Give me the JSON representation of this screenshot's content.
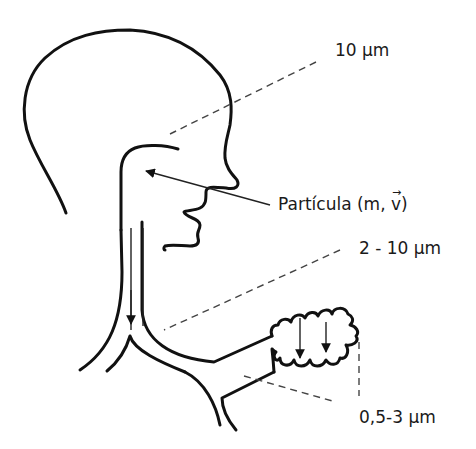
{
  "labels": {
    "upper_airway": "10 µm",
    "particle_prefix": "Partícula (m, ",
    "particle_vector": "v",
    "particle_suffix": ")",
    "vector_arrow": "→",
    "bronchi": "2 - 10 µm",
    "alveoli": "0,5-3 µm"
  },
  "figure": {
    "parts": [
      "head",
      "nasal-cavity",
      "trachea",
      "bronchi",
      "bronchiole",
      "alveoli"
    ],
    "arrows": [
      "particle-inhalation-arrow",
      "trachea-deposition-arrow",
      "alveoli-deposition-arrow-1",
      "alveoli-deposition-arrow-2"
    ],
    "line_color": "#111111",
    "dash_color": "#444444"
  }
}
